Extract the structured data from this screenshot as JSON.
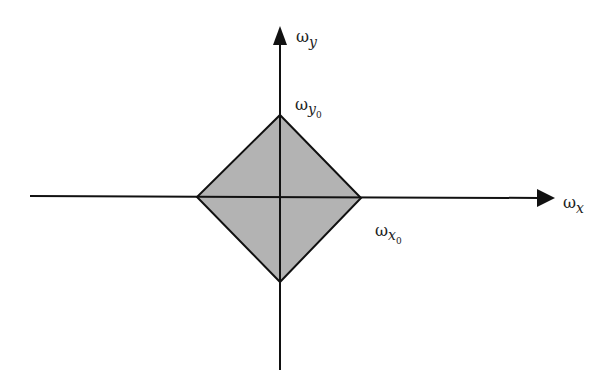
{
  "diagram": {
    "type": "frequency-domain support region (diamond)",
    "colors": {
      "background": "#ffffff",
      "fill": "#b3b3b3",
      "stroke": "#111111"
    },
    "axes": {
      "x": {
        "symbol": "ω",
        "subscript": "x"
      },
      "y": {
        "symbol": "ω",
        "subscript": "y"
      }
    },
    "region": {
      "shape": "diamond",
      "labels": {
        "y_intercept": {
          "symbol": "ω",
          "subscript": "y",
          "subsub": "0"
        },
        "x_intercept": {
          "symbol": "ω",
          "subscript": "x",
          "subsub": "0"
        }
      }
    }
  }
}
